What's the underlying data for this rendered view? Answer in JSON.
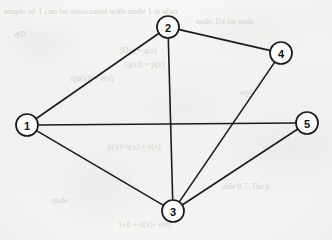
{
  "figure": {
    "kind": "undirected-graph-diagram",
    "background_color": "#f3f3f1",
    "ink_color": "#1a1a1a",
    "node_fill_color": "#fdfdfc"
  },
  "graph": {
    "node_radius": 11,
    "nodes": [
      {
        "id": "1",
        "label": "1",
        "x": 27,
        "y": 125
      },
      {
        "id": "2",
        "label": "2",
        "x": 168,
        "y": 27
      },
      {
        "id": "3",
        "label": "3",
        "x": 173,
        "y": 211
      },
      {
        "id": "4",
        "label": "4",
        "x": 281,
        "y": 53
      },
      {
        "id": "5",
        "label": "5",
        "x": 307,
        "y": 123
      }
    ],
    "edges": [
      {
        "from": "1",
        "to": "2"
      },
      {
        "from": "1",
        "to": "3"
      },
      {
        "from": "1",
        "to": "5"
      },
      {
        "from": "2",
        "to": "3"
      },
      {
        "from": "2",
        "to": "4"
      },
      {
        "from": "3",
        "to": "4"
      },
      {
        "from": "3",
        "to": "5"
      }
    ]
  },
  "ghost_text": [
    {
      "text": "ample of 1 can be associated with node 1 is also",
      "x": 4,
      "y": 6,
      "size": 9
    },
    {
      "text": "node. Dx for node",
      "x": 196,
      "y": 17,
      "size": 8
    },
    {
      "text": "e(D",
      "x": 14,
      "y": 30,
      "size": 8
    },
    {
      "text": "(Dx) = q(x)",
      "x": 120,
      "y": 46,
      "size": 8
    },
    {
      "text": "(q(x)) = p(x)",
      "x": 124,
      "y": 60,
      "size": 8
    },
    {
      "text": "c(p(x)) = e(x)",
      "x": 70,
      "y": 74,
      "size": 8
    },
    {
      "text": "a(p)",
      "x": 240,
      "y": 88,
      "size": 8
    },
    {
      "text": "p(y)+q(y) + e(x)",
      "x": 108,
      "y": 142,
      "size": 8
    },
    {
      "text": "able  0.7.  The p",
      "x": 222,
      "y": 182,
      "size": 8
    },
    {
      "text": "node",
      "x": 52,
      "y": 196,
      "size": 8
    },
    {
      "text": "1+8 +  d(x)+ e(n)",
      "x": 118,
      "y": 220,
      "size": 8
    }
  ]
}
